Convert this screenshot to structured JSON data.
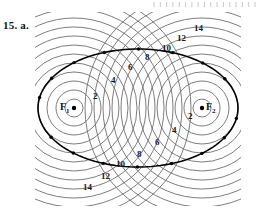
{
  "exercise": {
    "label": "15. a."
  },
  "ruler": {
    "name": "page-edge-tick-strip",
    "tick_count": 17,
    "color": "#c8c8c8"
  },
  "figure": {
    "background": "#ffffff",
    "circle_color": "#6e6e6e",
    "curve_color": "#000000",
    "clip": {
      "x": 35,
      "y": 12,
      "width": 206,
      "height": 194
    },
    "foci": [
      {
        "id": "F1",
        "label": "F",
        "sub": "1",
        "cx": 74,
        "cy": 108,
        "label_x": 60,
        "label_y": 102
      },
      {
        "id": "F2",
        "label": "F",
        "sub": "2",
        "cx": 202,
        "cy": 108,
        "label_x": 206,
        "label_y": 102
      }
    ],
    "circle_family": {
      "radius_step": 9,
      "count": 13,
      "description": "concentric circles of equal radial spacing drawn about each focus"
    },
    "ellipse": {
      "center_x": 138,
      "center_y": 108,
      "semi_major": 100,
      "semi_minor": 59,
      "vertex_left_x": 38,
      "vertex_right_x": 238,
      "point_count": 18
    },
    "labels": [
      {
        "text": "2",
        "x": 93,
        "y": 92,
        "group": "upper-left-from-F1"
      },
      {
        "text": "4",
        "x": 111,
        "y": 76,
        "group": "upper-left-from-F1"
      },
      {
        "text": "6",
        "x": 128,
        "y": 63,
        "group": "upper-left-from-F1"
      },
      {
        "text": "8",
        "x": 145,
        "y": 53,
        "group": "upper-left-from-F1"
      },
      {
        "text": "10",
        "x": 162,
        "y": 44,
        "group": "upper-left-from-F1"
      },
      {
        "text": "12",
        "x": 177,
        "y": 34,
        "group": "upper-left-from-F1"
      },
      {
        "text": "14",
        "x": 194,
        "y": 24,
        "group": "upper-left-from-F1"
      },
      {
        "text": "2",
        "x": 188,
        "y": 112,
        "group": "lower-right-from-F2"
      },
      {
        "text": "4",
        "x": 172,
        "y": 126,
        "group": "lower-right-from-F2"
      },
      {
        "text": "6",
        "x": 155,
        "y": 138,
        "group": "lower-right-from-F2"
      },
      {
        "text": "8",
        "x": 137,
        "y": 150,
        "group": "lower-right-from-F2"
      },
      {
        "text": "10",
        "x": 116,
        "y": 160,
        "group": "lower-right-from-F2"
      },
      {
        "text": "12",
        "x": 101,
        "y": 172,
        "group": "lower-right-from-F2"
      },
      {
        "text": "14",
        "x": 83,
        "y": 183,
        "group": "lower-right-from-F2"
      }
    ]
  }
}
